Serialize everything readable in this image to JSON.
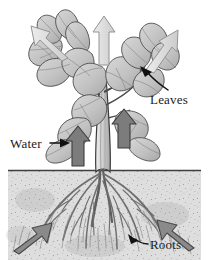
{
  "figure": {
    "background_color": "#ffffff"
  },
  "labels": {
    "leaves": "Leaves",
    "water": "Water",
    "roots": "Roots"
  },
  "colors": {
    "transpiration_arrow_fill": "#d6d6d6",
    "transpiration_arrow_stroke": "#8c8c8c",
    "uptake_arrow_fill": "#8a8a8a",
    "uptake_arrow_stroke": "#4f4f4f",
    "stem_arrow_fill": "#7c7c7c",
    "stem_arrow_stroke": "#3d3d3d",
    "soil_fill": "#dcdcdc",
    "soil_stroke": "#4a4a4a",
    "leaf_fill": "#c9c9c9",
    "leaf_stroke": "#4a4a4a",
    "stem_fill": "#d2d2d2",
    "stem_stroke": "#3a3a3a",
    "root_stroke": "#6b6b6b",
    "label_text": "#1a1a1a",
    "pointer_stroke": "#111111"
  },
  "geometry": {
    "width": 209,
    "height": 260,
    "soil_line_y": 170
  },
  "elements": {
    "transpiration_arrows": [
      {
        "name": "transpiration-arrow-left",
        "direction": "up-left"
      },
      {
        "name": "transpiration-arrow-center",
        "direction": "up"
      },
      {
        "name": "transpiration-arrow-right",
        "direction": "up-right"
      }
    ],
    "stem_arrows": [
      {
        "name": "stem-arrow-left",
        "direction": "up"
      },
      {
        "name": "stem-arrow-right",
        "direction": "up"
      }
    ],
    "soil_uptake_arrows": [
      {
        "name": "soil-arrow-left",
        "direction": "up-right"
      },
      {
        "name": "soil-arrow-right",
        "direction": "up-left"
      }
    ]
  }
}
